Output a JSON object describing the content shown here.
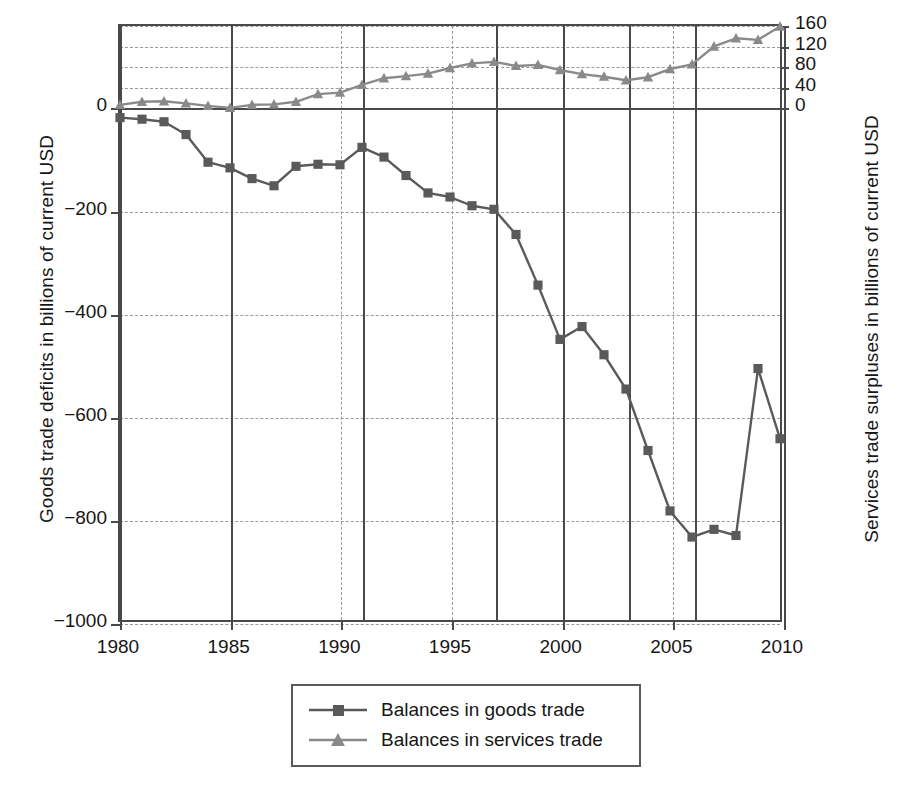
{
  "chart_data": {
    "type": "line",
    "title": "",
    "xlabel": "",
    "ylabel": "Goods trade deficits in billions of current USD",
    "ylabel_right": "Services trade surpluses in billions of current USD",
    "grid": true,
    "legend_position": "bottom-center",
    "x": [
      1980,
      1981,
      1982,
      1983,
      1984,
      1985,
      1986,
      1987,
      1988,
      1989,
      1990,
      1991,
      1992,
      1993,
      1994,
      1995,
      1996,
      1997,
      1998,
      1999,
      2000,
      2001,
      2002,
      2003,
      2004,
      2005,
      2006,
      2007,
      2008,
      2009,
      2010
    ],
    "xlim": [
      1980,
      2010
    ],
    "xticks": [
      1980,
      1985,
      1990,
      1995,
      2000,
      2005,
      2010
    ],
    "xtick_labels": [
      "1980",
      "1985",
      "1990",
      "1995",
      "2000",
      "2005",
      "2010"
    ],
    "ylim_left": [
      -1000,
      160
    ],
    "yticks_left": [
      0,
      -200,
      -400,
      -600,
      -800,
      -1000
    ],
    "ytick_labels_left": [
      "0",
      "−200",
      "−400",
      "−600",
      "−800",
      "−1000"
    ],
    "ylim_right": [
      -1000,
      160
    ],
    "yticks_right": [
      0,
      40,
      80,
      120,
      160
    ],
    "ytick_labels_right": [
      "0",
      "40",
      "80",
      "120",
      "160"
    ],
    "vertical_marker_lines_solid": [
      1980,
      1985,
      1991,
      1997,
      2000,
      2003,
      2006,
      2010
    ],
    "vertical_gridlines_dashed": [
      1990,
      1995,
      2005
    ],
    "series": [
      {
        "name": "Balances in goods trade",
        "axis": "left",
        "color": "#5a5a5a",
        "marker": "square",
        "values": [
          -19,
          -22,
          -27,
          -52,
          -106,
          -117,
          -138,
          -152,
          -114,
          -110,
          -111,
          -77,
          -96,
          -132,
          -166,
          -174,
          -191,
          -198,
          -247,
          -346,
          -452,
          -427,
          -482,
          -549,
          -669,
          -787,
          -838,
          -823,
          -835,
          -509,
          -646
        ]
      },
      {
        "name": "Balances in services trade",
        "axis": "right",
        "color": "#8a8a8a",
        "marker": "triangle",
        "values": [
          6,
          12,
          13,
          9,
          4,
          0,
          6,
          7,
          12,
          27,
          30,
          45,
          58,
          62,
          67,
          78,
          87,
          90,
          82,
          84,
          74,
          66,
          61,
          54,
          60,
          76,
          85,
          120,
          136,
          133,
          159
        ]
      }
    ]
  },
  "legend": {
    "items": [
      {
        "label": "Balances in goods trade",
        "marker": "square-marker"
      },
      {
        "label": "Balances in services trade",
        "marker": "triangle-marker"
      }
    ]
  },
  "axes": {
    "left_title": "Goods trade deficits in billions of current USD",
    "right_title": "Services trade surpluses in billions of current USD"
  },
  "colors": {
    "goods": "#5a5a5a",
    "services": "#8a8a8a",
    "axis": "#4a4a4a",
    "grid": "#9a9a9a",
    "text": "#161616"
  }
}
